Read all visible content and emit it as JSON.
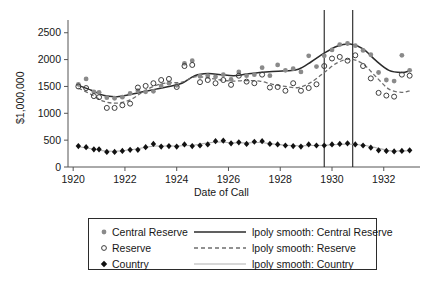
{
  "chart_data": {
    "type": "scatter",
    "title": "",
    "xlabel": "Date of Call",
    "ylabel": "$1,000,000",
    "xlim": [
      1919.8,
      1933.4
    ],
    "ylim": [
      0,
      2700
    ],
    "grid": false,
    "legend_position": "below-plot",
    "xticks": [
      "1920",
      "1922",
      "1924",
      "1926",
      "1928",
      "1930",
      "1932"
    ],
    "xtick_values": [
      1920,
      1922,
      1924,
      1926,
      1928,
      1930,
      1932
    ],
    "yticks": [
      "0",
      "500",
      "1000",
      "1500",
      "2000",
      "2500"
    ],
    "ytick_values": [
      0,
      500,
      1000,
      1500,
      2000,
      2500
    ],
    "annotations": [
      {
        "type": "vline",
        "x": 1929.7,
        "label": ""
      },
      {
        "type": "vline",
        "x": 1930.8,
        "label": ""
      }
    ],
    "series": [
      {
        "name": "Central Reserve",
        "marker": "filled-circle",
        "color": "#8a8a8a",
        "x": [
          1920.2,
          1920.5,
          1920.8,
          1921.0,
          1921.3,
          1921.6,
          1921.9,
          1922.2,
          1922.5,
          1922.8,
          1923.1,
          1923.4,
          1923.7,
          1924.0,
          1924.3,
          1924.6,
          1924.9,
          1925.2,
          1925.5,
          1925.8,
          1926.1,
          1926.4,
          1926.7,
          1927.0,
          1927.3,
          1927.6,
          1927.9,
          1928.2,
          1928.5,
          1928.8,
          1929.1,
          1929.4,
          1929.7,
          1930.0,
          1930.3,
          1930.6,
          1930.9,
          1931.2,
          1931.5,
          1931.8,
          1932.1,
          1932.4,
          1932.7,
          1933.0
        ],
        "y": [
          1540,
          1640,
          1400,
          1390,
          1290,
          1280,
          1300,
          1370,
          1420,
          1400,
          1410,
          1510,
          1560,
          1520,
          1930,
          1980,
          1690,
          1700,
          1680,
          1720,
          1630,
          1770,
          1700,
          1720,
          1850,
          1700,
          1900,
          1800,
          1830,
          1770,
          2070,
          1870,
          2070,
          2180,
          2280,
          2300,
          2260,
          2170,
          2090,
          1760,
          1620,
          1600,
          2080,
          1800
        ]
      },
      {
        "name": "Reserve",
        "marker": "open-circle",
        "color": "#3d3d3d",
        "x": [
          1920.2,
          1920.5,
          1920.8,
          1921.0,
          1921.3,
          1921.6,
          1921.9,
          1922.2,
          1922.5,
          1922.8,
          1923.1,
          1923.4,
          1923.7,
          1924.0,
          1924.3,
          1924.6,
          1924.9,
          1925.2,
          1925.5,
          1925.8,
          1926.1,
          1926.4,
          1926.7,
          1927.0,
          1927.3,
          1927.6,
          1927.9,
          1928.2,
          1928.5,
          1928.8,
          1929.1,
          1929.4,
          1929.7,
          1930.0,
          1930.3,
          1930.6,
          1930.9,
          1931.2,
          1931.5,
          1931.8,
          1932.1,
          1932.4,
          1932.7,
          1933.0
        ],
        "y": [
          1500,
          1470,
          1320,
          1300,
          1100,
          1100,
          1150,
          1180,
          1480,
          1510,
          1560,
          1620,
          1640,
          1490,
          1880,
          1900,
          1580,
          1620,
          1560,
          1620,
          1530,
          1700,
          1590,
          1560,
          1720,
          1480,
          1490,
          1420,
          1560,
          1420,
          1470,
          1540,
          1880,
          2020,
          2050,
          1980,
          2080,
          1880,
          1650,
          1380,
          1330,
          1310,
          1720,
          1700
        ]
      },
      {
        "name": "Country",
        "marker": "filled-diamond",
        "color": "#111111",
        "x": [
          1920.2,
          1920.5,
          1920.8,
          1921.0,
          1921.3,
          1921.6,
          1921.9,
          1922.2,
          1922.5,
          1922.8,
          1923.1,
          1923.4,
          1923.7,
          1924.0,
          1924.3,
          1924.6,
          1924.9,
          1925.2,
          1925.5,
          1925.8,
          1926.1,
          1926.4,
          1926.7,
          1927.0,
          1927.3,
          1927.6,
          1927.9,
          1928.2,
          1928.5,
          1928.8,
          1929.1,
          1929.4,
          1929.7,
          1930.0,
          1930.3,
          1930.6,
          1930.9,
          1931.2,
          1931.5,
          1931.8,
          1932.1,
          1932.4,
          1932.7,
          1933.0
        ],
        "y": [
          390,
          370,
          330,
          330,
          280,
          280,
          300,
          320,
          320,
          370,
          430,
          380,
          390,
          380,
          420,
          390,
          400,
          420,
          480,
          490,
          440,
          460,
          430,
          470,
          480,
          430,
          420,
          400,
          390,
          380,
          420,
          400,
          400,
          420,
          430,
          440,
          420,
          400,
          360,
          310,
          300,
          290,
          300,
          310
        ]
      }
    ],
    "smooth_lines": [
      {
        "name": "lpoly smooth: Central Reserve",
        "style": "solid",
        "color": "#2b2b2b",
        "x": [
          1920.2,
          1920.7,
          1921.2,
          1921.7,
          1922.2,
          1922.7,
          1923.2,
          1923.7,
          1924.2,
          1924.7,
          1925.2,
          1925.7,
          1926.2,
          1926.7,
          1927.2,
          1927.7,
          1928.2,
          1928.7,
          1929.2,
          1929.7,
          1930.2,
          1930.7,
          1931.2,
          1931.7,
          1932.2,
          1932.7,
          1933.0
        ],
        "y": [
          1520,
          1430,
          1330,
          1310,
          1350,
          1400,
          1450,
          1500,
          1560,
          1700,
          1740,
          1720,
          1700,
          1730,
          1760,
          1780,
          1790,
          1820,
          1960,
          2120,
          2250,
          2290,
          2200,
          1980,
          1800,
          1760,
          1790
        ]
      },
      {
        "name": "lpoly smooth: Reserve",
        "style": "dashed",
        "color": "#6e6e6e",
        "x": [
          1920.2,
          1920.7,
          1921.2,
          1921.7,
          1922.2,
          1922.7,
          1923.2,
          1923.7,
          1924.2,
          1924.7,
          1925.2,
          1925.7,
          1926.2,
          1926.7,
          1927.2,
          1927.7,
          1928.2,
          1928.7,
          1929.2,
          1929.7,
          1930.2,
          1930.7,
          1931.2,
          1931.7,
          1932.2,
          1932.7,
          1933.0
        ],
        "y": [
          1470,
          1350,
          1220,
          1190,
          1250,
          1400,
          1520,
          1570,
          1580,
          1680,
          1660,
          1620,
          1600,
          1610,
          1600,
          1540,
          1500,
          1480,
          1580,
          1760,
          1940,
          2010,
          1920,
          1680,
          1450,
          1390,
          1420
        ]
      },
      {
        "name": "lpoly smooth: Country",
        "style": "solid-light",
        "color": "#b0b0b0",
        "x": [
          1920.2,
          1920.7,
          1921.2,
          1921.7,
          1922.2,
          1922.7,
          1923.2,
          1923.7,
          1924.2,
          1924.7,
          1925.2,
          1925.7,
          1926.2,
          1926.7,
          1927.2,
          1927.7,
          1928.2,
          1928.7,
          1929.2,
          1929.7,
          1930.2,
          1930.7,
          1931.2,
          1931.7,
          1932.2,
          1932.7,
          1933.0
        ],
        "y": [
          380,
          340,
          300,
          295,
          320,
          360,
          390,
          390,
          395,
          410,
          450,
          465,
          450,
          450,
          455,
          430,
          405,
          395,
          400,
          405,
          420,
          425,
          405,
          360,
          305,
          300,
          305
        ]
      }
    ]
  },
  "axes": {
    "ylabel": "$1,000,000",
    "xlabel": "Date of Call"
  },
  "legend": {
    "markers": [
      {
        "label": "Central Reserve",
        "icon": "filled-circle-marker-icon"
      },
      {
        "label": "Reserve",
        "icon": "open-circle-marker-icon"
      },
      {
        "label": "Country",
        "icon": "filled-diamond-marker-icon"
      }
    ],
    "lines": [
      {
        "label": "lpoly smooth: Central Reserve",
        "icon": "solid-line-icon"
      },
      {
        "label": "lpoly smooth: Reserve",
        "icon": "dashed-line-icon"
      },
      {
        "label": "lpoly smooth: Country",
        "icon": "light-solid-line-icon"
      }
    ]
  },
  "colors": {
    "central_reserve": "#8a8a8a",
    "reserve": "#3d3d3d",
    "country": "#111111",
    "smooth_central": "#2b2b2b",
    "smooth_reserve": "#6e6e6e",
    "smooth_country": "#b0b0b0",
    "axis": "#555555",
    "background": "#ffffff"
  }
}
